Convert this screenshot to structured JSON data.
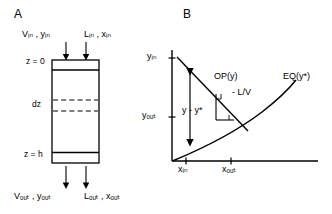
{
  "figure": {
    "panel_a": {
      "letter": "A",
      "inlet_vapor": "Vᵢₙ , yᵢₙ",
      "inlet_liquid": "Lᵢₙ , xᵢₙ",
      "top_position": "z = 0",
      "element_height": "dz",
      "bottom_position": "z = h",
      "outlet_vapor": "Vₒᵤₜ , yₒᵤₜ",
      "outlet_liquid": "Lₒᵤₜ , xₒᵤₜ",
      "column_label": "packed-column",
      "arrows": {
        "inlet_vapor_arrow": "down-arrow",
        "inlet_liquid_arrow": "down-arrow",
        "outlet_vapor_arrow": "down-arrow",
        "outlet_liquid_arrow": "down-arrow"
      }
    },
    "panel_b": {
      "letter": "B",
      "y_axis_top_tick": "yᵢₙ",
      "y_axis_lower_tick": "yₒᵤₜ",
      "x_axis_left_tick": "xᵢₙ",
      "x_axis_right_tick": "xₒᵤₜ",
      "operating_line_label": "OP(y)",
      "slope_label": "- L/V",
      "driving_force_label": "y - y*",
      "equilibrium_label": "EQ(y*)",
      "axis_names": {
        "vertical": "y-axis",
        "horizontal": "x-axis"
      }
    }
  },
  "colors": {
    "ink": "#000000",
    "background": "#ffffff"
  }
}
